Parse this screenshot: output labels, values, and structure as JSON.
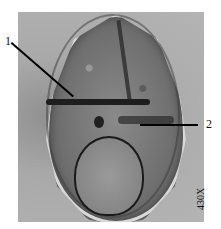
{
  "figure": {
    "labels": [
      {
        "id": "1",
        "text": "1"
      },
      {
        "id": "2",
        "text": "2"
      }
    ],
    "magnification": "430X"
  }
}
